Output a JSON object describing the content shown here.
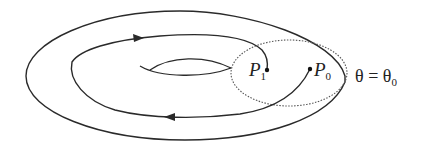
{
  "diagram": {
    "type": "torus-poincare-section",
    "stroke_color": "#2a2a2a",
    "section_stroke_color": "#555555",
    "points": [
      {
        "id": "P1",
        "name": "P",
        "subscript": "1",
        "x": 267,
        "y": 70
      },
      {
        "id": "P0",
        "name": "P",
        "subscript": "0",
        "x": 310,
        "y": 69
      }
    ],
    "section_label": {
      "lhs": "θ",
      "eq": " = ",
      "rhs": "θ",
      "rhs_subscript": "0"
    },
    "arrows": [
      {
        "location": "upper-trajectory",
        "direction": "right"
      },
      {
        "location": "lower-trajectory",
        "direction": "left"
      }
    ]
  }
}
